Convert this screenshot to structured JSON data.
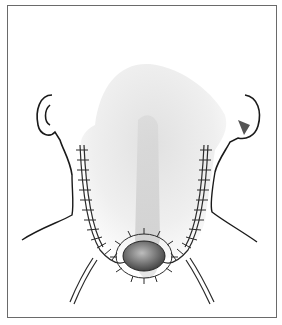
{
  "figure": {
    "frame_color": "#6a6a6a",
    "line_color": "#1a1a1a",
    "stipple_color": "#8a8a8a",
    "elements": [
      "left-ear",
      "right-ear",
      "neck-outline",
      "skin-flap",
      "suture-lines",
      "stoma",
      "drain-tubes"
    ]
  }
}
